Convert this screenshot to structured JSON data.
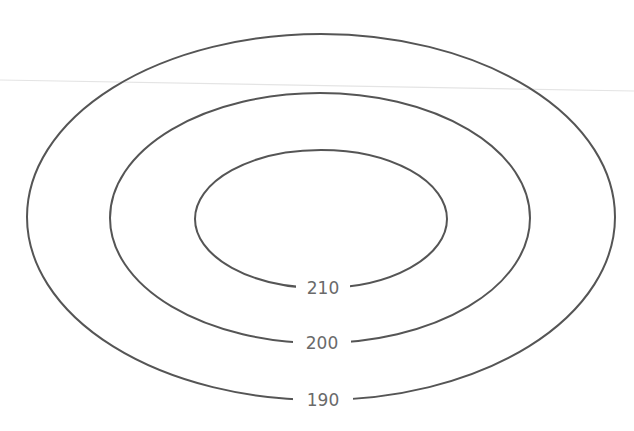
{
  "diagram": {
    "type": "contour-plot",
    "stroke_color": "#555555",
    "label_color": "#6a6a6a",
    "background": "#ffffff",
    "faint_line": {
      "x1": 0,
      "y1": 80,
      "x2": 634,
      "y2": 91,
      "color": "#e4e4e4"
    },
    "contours": [
      {
        "level": "190",
        "cx": 321,
        "cy": 217,
        "rx": 294,
        "ry": 183,
        "label_y": 400,
        "gap_half": 30
      },
      {
        "level": "200",
        "cx": 320,
        "cy": 218,
        "rx": 210,
        "ry": 125,
        "label_y": 343,
        "gap_half": 29
      },
      {
        "level": "210",
        "cx": 321,
        "cy": 219,
        "rx": 126,
        "ry": 69,
        "label_y": 288,
        "gap_half": 27
      }
    ]
  },
  "chart_data": {
    "type": "contour",
    "title": "",
    "xlabel": "",
    "ylabel": "",
    "levels": [
      190,
      200,
      210
    ],
    "contour_labels": [
      "190",
      "200",
      "210"
    ],
    "shape": "concentric ellipses, highest value (210) innermost",
    "grid": false,
    "legend": "none"
  }
}
